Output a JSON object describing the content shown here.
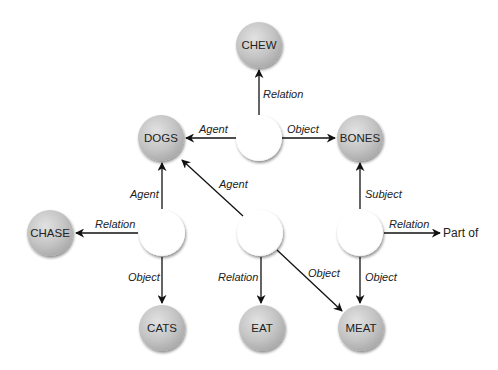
{
  "diagram": {
    "type": "semantic-network",
    "concepts": [
      {
        "id": "chew",
        "label": "CHEW",
        "x": 259,
        "y": 45
      },
      {
        "id": "dogs",
        "label": "DOGS",
        "x": 161,
        "y": 138
      },
      {
        "id": "bones",
        "label": "BONES",
        "x": 360,
        "y": 138
      },
      {
        "id": "chase",
        "label": "CHASE",
        "x": 50,
        "y": 233
      },
      {
        "id": "cats",
        "label": "CATS",
        "x": 162,
        "y": 328
      },
      {
        "id": "eat",
        "label": "EAT",
        "x": 262,
        "y": 328
      },
      {
        "id": "meat",
        "label": "MEAT",
        "x": 361,
        "y": 328
      }
    ],
    "propositions": [
      {
        "id": "p1",
        "x": 259,
        "y": 138
      },
      {
        "id": "p2",
        "x": 162,
        "y": 233
      },
      {
        "id": "p3",
        "x": 260,
        "y": 233
      },
      {
        "id": "p4",
        "x": 360,
        "y": 233
      }
    ],
    "edges": [
      {
        "from": "p1",
        "to": "chew",
        "label": "Relation"
      },
      {
        "from": "p1",
        "to": "dogs",
        "label": "Agent"
      },
      {
        "from": "p1",
        "to": "bones",
        "label": "Object"
      },
      {
        "from": "p2",
        "to": "dogs",
        "label": "Agent"
      },
      {
        "from": "p2",
        "to": "chase",
        "label": "Relation"
      },
      {
        "from": "p2",
        "to": "cats",
        "label": "Object"
      },
      {
        "from": "p3",
        "to": "dogs",
        "label": "Agent"
      },
      {
        "from": "p3",
        "to": "eat",
        "label": "Relation"
      },
      {
        "from": "p3",
        "to": "meat",
        "label": "Object"
      },
      {
        "from": "p4",
        "to": "bones",
        "label": "Subject"
      },
      {
        "from": "p4",
        "to": "part_of",
        "label": "Relation"
      },
      {
        "from": "p4",
        "to": "meat",
        "label": "Object"
      }
    ],
    "part_of_label": "Part of",
    "colors": {
      "concept_fill": "#bdbdbd",
      "proposition_fill": "#ffffff",
      "edge": "#111111"
    }
  }
}
